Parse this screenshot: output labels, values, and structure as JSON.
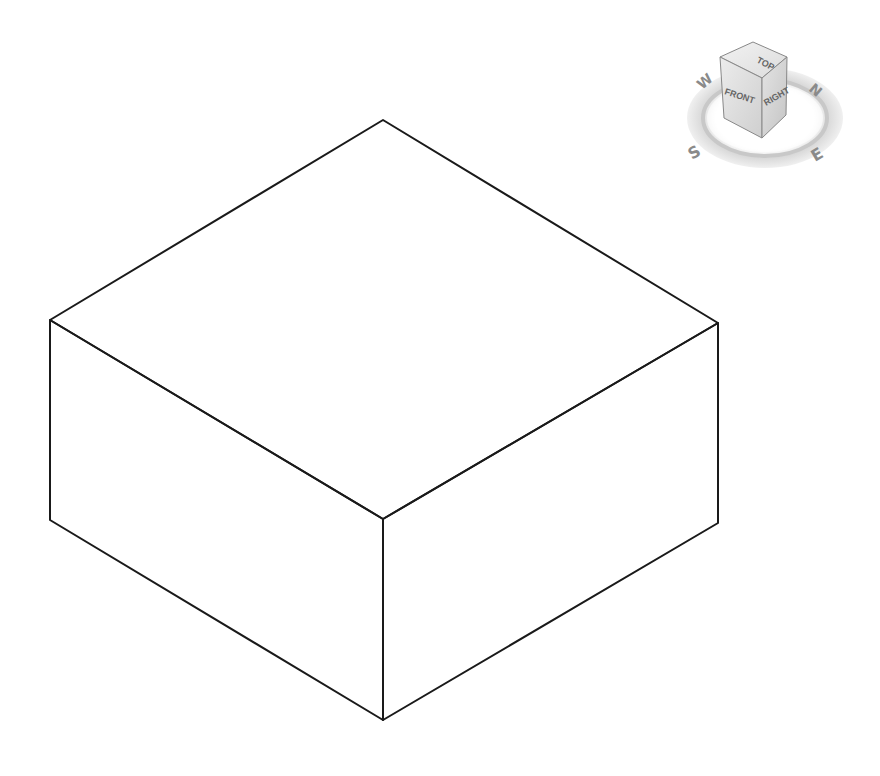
{
  "viewport": {
    "background": "#ffffff",
    "edge_color": "#1a1a1a",
    "model": {
      "type": "box",
      "view": "isometric",
      "vertices": {
        "top_back": [
          383,
          120
        ],
        "top_left": [
          50,
          320
        ],
        "top_right": [
          718,
          323
        ],
        "top_front": [
          383,
          519
        ],
        "bottom_left": [
          50,
          520
        ],
        "bottom_right": [
          718,
          523
        ],
        "bottom_front": [
          383,
          720
        ]
      }
    }
  },
  "viewcube": {
    "faces": {
      "top": "TOP",
      "front": "FRONT",
      "right": "RIGHT"
    },
    "compass": {
      "north": "N",
      "south": "S",
      "east": "E",
      "west": "W"
    }
  }
}
